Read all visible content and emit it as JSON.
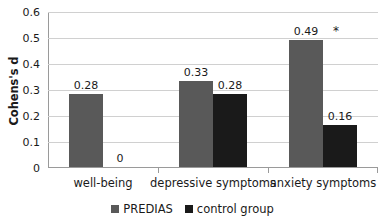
{
  "chart_data": {
    "type": "bar",
    "title": "",
    "xlabel": "",
    "ylabel": "Cohens's d",
    "ylim": [
      0,
      0.6
    ],
    "ytick_values": [
      0,
      0.1,
      0.2,
      0.3,
      0.4,
      0.5,
      0.6
    ],
    "ytick_labels": [
      "0",
      "0.1",
      "0.2",
      "0.3",
      "0.4",
      "0.5",
      "0.6"
    ],
    "grid": true,
    "legend_position": "bottom",
    "categories": [
      "well-being",
      "depressive symptoms",
      "anxiety symptoms"
    ],
    "series": [
      {
        "name": "PREDIAS",
        "color": "#595959",
        "values": [
          0.28,
          0.33,
          0.49
        ],
        "labels": [
          "0.28",
          "0.33",
          "0.49"
        ]
      },
      {
        "name": "control group",
        "color": "#1a1a1a",
        "values": [
          0,
          0.28,
          0.16
        ],
        "labels": [
          "0",
          "0.28",
          "0.16"
        ]
      }
    ],
    "annotations": [
      {
        "text": "*",
        "category": "anxiety symptoms",
        "series": "PREDIAS",
        "note": "significance marker right of 0.49 label"
      }
    ]
  }
}
